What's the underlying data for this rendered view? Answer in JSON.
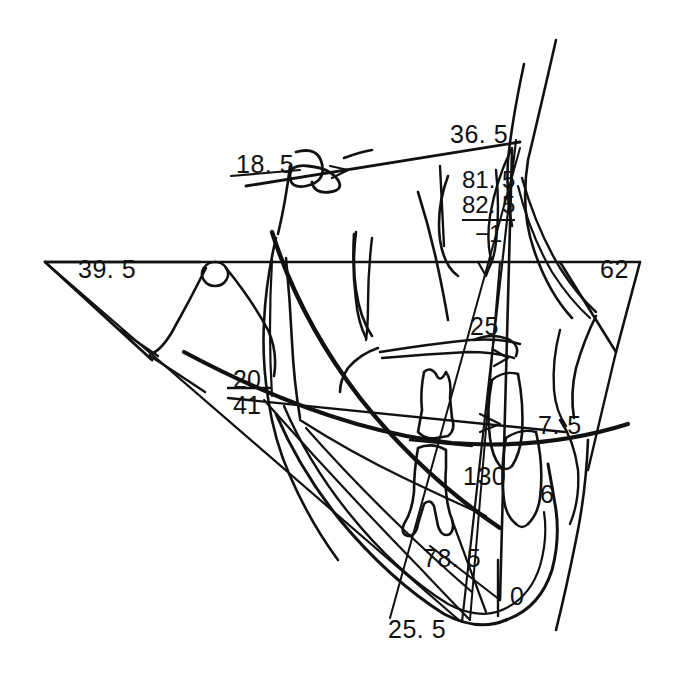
{
  "figure": {
    "type": "cephalometric-tracing",
    "background_color": "#ffffff",
    "ink_color": "#111111"
  },
  "measurements": [
    {
      "id": "m-18-5",
      "value": "18. 5",
      "x": 236,
      "y": 152,
      "size": 25,
      "note": "upper-left, above sella-nasion style line"
    },
    {
      "id": "m-36-5",
      "value": "36. 5",
      "x": 450,
      "y": 122,
      "size": 25,
      "note": "upper-right, at anterior cranial base terminus"
    },
    {
      "id": "m-39-5",
      "value": "39. 5",
      "x": 78,
      "y": 257,
      "size": 25,
      "note": "left, inside open triangle on horizontal plane"
    },
    {
      "id": "m-62",
      "value": "62",
      "x": 600,
      "y": 257,
      "size": 25,
      "note": "right, inside downward triangle on horizontal plane"
    },
    {
      "id": "m-25",
      "value": "25",
      "x": 470,
      "y": 314,
      "size": 25,
      "note": "mid-right, maxilla region"
    },
    {
      "id": "m-7-5",
      "value": "7. 5",
      "x": 538,
      "y": 413,
      "size": 25,
      "note": "right, incisor overjet region"
    },
    {
      "id": "m-6",
      "value": "6",
      "x": 540,
      "y": 482,
      "size": 25,
      "note": "right, lower incisor region"
    },
    {
      "id": "m-130",
      "value": "130",
      "x": 463,
      "y": 464,
      "size": 25,
      "note": "center, lower molar region"
    },
    {
      "id": "m-78-5",
      "value": "78. 5",
      "x": 423,
      "y": 546,
      "size": 25,
      "note": "lower center, symphysis region"
    },
    {
      "id": "m-0",
      "value": "0",
      "x": 510,
      "y": 584,
      "size": 25,
      "note": "lower right, chin region"
    },
    {
      "id": "m-25-5",
      "value": "25. 5",
      "x": 388,
      "y": 617,
      "size": 25,
      "note": "bottom left of chin"
    }
  ],
  "measurement_stacks": [
    {
      "id": "stack-81-82",
      "x": 462,
      "y": 168,
      "size": 24,
      "lines": [
        {
          "text": "81. 5",
          "rule_below": false
        },
        {
          "text": "82. 5",
          "rule_below": true
        },
        {
          "text": "−1",
          "rule_below": false
        }
      ],
      "note": "bracketed stack at maxilla: 81.5 over 82.5 over minus one"
    }
  ],
  "leader_lines": [
    {
      "id": "leader-18-5",
      "note": "short horizontal rule under 18.5"
    },
    {
      "id": "leader-20-41",
      "note": "horizontal rule separating 20 and 41"
    }
  ],
  "stacked_left": {
    "id": "stack-20-41",
    "x": 233,
    "y": 366,
    "size": 25,
    "top": "20",
    "bottom": "41",
    "note": "ramus region, 20 above rule, 41 below"
  }
}
